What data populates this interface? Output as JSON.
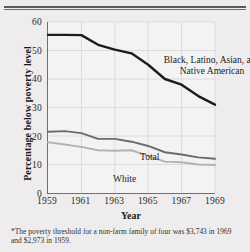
{
  "figure": {
    "footnote": "*The poverty threshold for a non-farm family of four was $3,743 in 1969 and $2,973 in 1959."
  },
  "chart_data": {
    "type": "line",
    "title": "",
    "xlabel": "Year",
    "ylabel": "Percentage below poverty level",
    "xlim": [
      1959,
      1969
    ],
    "ylim": [
      0,
      60
    ],
    "grid": true,
    "legend_position": "inline-annotations",
    "xticks": [
      "1959",
      "1961",
      "1963",
      "1965",
      "1967",
      "1969"
    ],
    "xtick_values": [
      1959,
      1961,
      1963,
      1965,
      1967,
      1969
    ],
    "yticks": [
      "0",
      "10",
      "20",
      "30",
      "40",
      "50",
      "60"
    ],
    "ytick_values": [
      0,
      10,
      20,
      30,
      40,
      50,
      60
    ],
    "x": [
      1959,
      1960,
      1961,
      1962,
      1963,
      1964,
      1965,
      1966,
      1967,
      1968,
      1969
    ],
    "series": [
      {
        "name": "Black, Latino, Asian, and Native American",
        "label": "Black, Latino, Asian, and\nNative American",
        "color": "#1c1c1c",
        "width": 2.4,
        "values": [
          55.5,
          55.5,
          55.4,
          52.0,
          50.3,
          49.0,
          45.0,
          40.0,
          38.0,
          34.0,
          31.0
        ]
      },
      {
        "name": "Total",
        "label": "Total",
        "color": "#6b6b6b",
        "width": 1.9,
        "values": [
          21.5,
          21.7,
          21.0,
          19.0,
          19.0,
          18.0,
          16.5,
          14.3,
          13.5,
          12.5,
          12.0
        ]
      },
      {
        "name": "White",
        "label": "White",
        "color": "#b3b3b3",
        "width": 1.9,
        "values": [
          17.8,
          17.0,
          16.2,
          15.0,
          14.8,
          15.0,
          13.0,
          11.0,
          10.8,
          10.0,
          9.8
        ]
      }
    ]
  }
}
